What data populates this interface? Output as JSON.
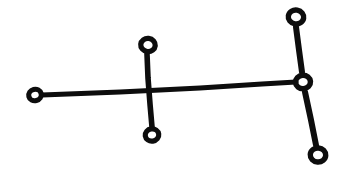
{
  "figure": {
    "title": "Node-link line figure",
    "style": "hand-inked black ink on white paper",
    "background_color": "#ffffff",
    "ink_color": "#0d0d0d",
    "canvas": {
      "width": 349,
      "height": 186
    }
  },
  "chart_data": {
    "type": "diagram",
    "title": "Node-link line figure",
    "xlabel": "",
    "ylabel": "",
    "xlim": [
      0,
      349
    ],
    "ylim": [
      0,
      186
    ],
    "grid": false,
    "legend": "none",
    "nodes": [
      {
        "id": "n1",
        "label": "left-endpoint",
        "x": 35,
        "y": 95,
        "outer_radius": 8.5,
        "inner_radius": 3.4,
        "ring_width": 5.1,
        "rotation": -14
      },
      {
        "id": "n2",
        "label": "upper-middle",
        "x": 148,
        "y": 45,
        "outer_radius": 9.5,
        "inner_radius": 4.2,
        "ring_width": 5.3,
        "rotation": 6
      },
      {
        "id": "n3",
        "label": "lower-middle",
        "x": 152,
        "y": 135,
        "outer_radius": 9.0,
        "inner_radius": 3.8,
        "ring_width": 5.2,
        "rotation": -8
      },
      {
        "id": "n4",
        "label": "upper-right",
        "x": 296,
        "y": 17,
        "outer_radius": 10.0,
        "inner_radius": 4.6,
        "ring_width": 5.4,
        "rotation": 10
      },
      {
        "id": "n5",
        "label": "right-junction",
        "x": 303,
        "y": 82,
        "outer_radius": 9.8,
        "inner_radius": 4.3,
        "ring_width": 5.5,
        "rotation": -4
      },
      {
        "id": "n6",
        "label": "lower-right",
        "x": 318,
        "y": 155,
        "outer_radius": 10.0,
        "inner_radius": 4.6,
        "ring_width": 5.4,
        "rotation": 4
      }
    ],
    "edges": [
      {
        "id": "e1",
        "label": "left-spine",
        "from": "n1",
        "to": "n5",
        "path": "M 42 95 L 120 92 L 200 88 L 262 84 L 296 82",
        "width": 5.0
      },
      {
        "id": "e2",
        "label": "middle-vertical",
        "from": "n2",
        "to": "n3",
        "path": "M 147 54 L 148 78 L 150 104 L 152 127",
        "width": 5.6
      },
      {
        "id": "e3",
        "label": "upper-right-branch",
        "from": "n4",
        "to": "n5",
        "path": "M 296 27 L 299 50 L 302 72",
        "width": 6.0
      },
      {
        "id": "e4",
        "label": "lower-right-branch",
        "from": "n5",
        "to": "n6",
        "path": "M 305 92 L 311 120 L 316 145",
        "width": 6.0
      }
    ]
  }
}
